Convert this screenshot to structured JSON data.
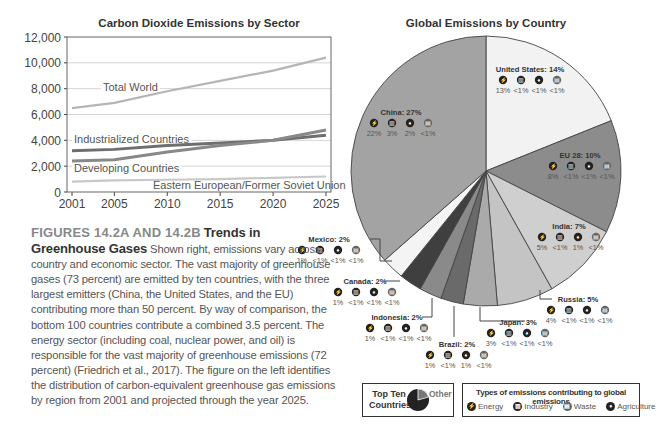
{
  "chart_data": [
    {
      "type": "line",
      "title": "Carbon Dioxide Emissions by Sector",
      "xlabel": "",
      "ylabel": "",
      "x": [
        2001,
        2005,
        2010,
        2015,
        2020,
        2025
      ],
      "xticks": [
        "2001",
        "2005",
        "2010",
        "2015",
        "2020",
        "2025"
      ],
      "yticks": [
        "0",
        "2,000",
        "4,000",
        "6,000",
        "8,000",
        "10,000",
        "12,000"
      ],
      "ylim": [
        0,
        12000
      ],
      "grid": true,
      "series": [
        {
          "name": "Total World",
          "values": [
            6500,
            6900,
            7800,
            8600,
            9400,
            10400
          ],
          "color": "#b5b5b5"
        },
        {
          "name": "Industrialized Countries",
          "values": [
            3200,
            3300,
            3600,
            3800,
            4000,
            4400
          ],
          "color": "#6e6e6e"
        },
        {
          "name": "Developing Countries",
          "values": [
            2400,
            2500,
            3100,
            3600,
            4000,
            4800
          ],
          "color": "#888888"
        },
        {
          "name": "Eastern European/Former Soviet Union",
          "values": [
            800,
            900,
            950,
            1000,
            1100,
            1200
          ],
          "color": "#c8c8c8"
        }
      ]
    },
    {
      "type": "pie",
      "title": "Global Emissions by Country",
      "categories": [
        "United States",
        "EU 28",
        "India",
        "Russia",
        "Japan",
        "Brazil",
        "Indonesia",
        "Canada",
        "Mexico",
        "China"
      ],
      "values": [
        14,
        10,
        7,
        5,
        3,
        2,
        2,
        2,
        2,
        27
      ],
      "labels": [
        "United States: 14%",
        "EU 28: 10%",
        "India: 7%",
        "Russia: 5%",
        "Japan: 3%",
        "Brazil: 2%",
        "Indonesia: 2%",
        "Canada: 2%",
        "Mexico: 2%",
        "China: 27%"
      ],
      "breakdown": {
        "China": [
          "22%",
          "3%",
          "2%",
          "<1%"
        ],
        "United States": [
          "13%",
          "<1%",
          "<1%",
          "<1%"
        ],
        "EU 28": [
          "8%",
          "<1%",
          "<1%",
          "<1%"
        ],
        "India": [
          "5%",
          "<1%",
          "1%",
          "<1%"
        ],
        "Russia": [
          "4%",
          "<1%",
          "<1%",
          "<1%"
        ],
        "Japan": [
          "3%",
          "<1%",
          "<1%",
          "<1%"
        ],
        "Brazil": [
          "1%",
          "<1%",
          "1%",
          "<1%"
        ],
        "Indonesia": [
          "1%",
          "<1%",
          "<1%",
          "<1%"
        ],
        "Canada": [
          "1%",
          "<1%",
          "<1%",
          "<1%"
        ],
        "Mexico": [
          "1%",
          "<1%",
          "<1%",
          "<1%"
        ]
      },
      "breakdown_order": [
        "Energy",
        "Industry",
        "Agriculture",
        "Waste"
      ],
      "colors": [
        "#f2f2f2",
        "#8c8c8c",
        "#cfcfcf",
        "#c4c4c4",
        "#aaaaaa",
        "#6a6a6a",
        "#8a8a8a",
        "#3f3f3f",
        "#f4f4f4",
        "#a3a3a3"
      ]
    }
  ],
  "line_chart": {
    "title": "Carbon Dioxide Emissions by Sector",
    "labels": {
      "total": "Total World",
      "industrialized": "Industrialized Countries",
      "developing": "Developing Countries",
      "eastern": "Eastern European/Former Soviet Union"
    }
  },
  "caption": {
    "figure": "FIGURES 14.2A AND 14.2B",
    "title": "Trends in Greenhouse Gases",
    "body": "Shown right, emissions vary across country and economic sector. The vast majority of greenhouse gases (73 percent) are emitted by ten countries, with the three largest emitters (China, the United States, and the EU) contributing more than 50 percent. By way of comparison, the bottom 100 countries contribute a combined 3.5 percent. The energy sector (including coal, nuclear power, and oil) is responsible for the vast majority of greenhouse emissions (72 percent) (Friedrich et al., 2017). The figure on the left identifies the distribution of carbon-equivalent greenhouse gas emissions by region from 2001 and projected through the year 2025."
  },
  "pie_chart": {
    "title": "Global Emissions by Country"
  },
  "legend": {
    "top_ten": "Top Ten Countries",
    "other": "Other",
    "types_title": "Types of emissions contributing to global emissions",
    "types": [
      {
        "icon": "energy-icon",
        "glyph": "⚡",
        "label": "Energy"
      },
      {
        "icon": "industry-icon",
        "glyph": "▥",
        "label": "Industry"
      },
      {
        "icon": "waste-icon",
        "glyph": "▤",
        "label": "Waste"
      },
      {
        "icon": "agriculture-icon",
        "glyph": "♦",
        "label": "Agriculture"
      }
    ]
  }
}
